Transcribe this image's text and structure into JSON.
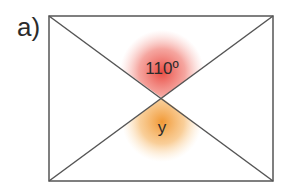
{
  "figure": {
    "label": "a)",
    "angle_top": "110º",
    "angle_bottom": "y",
    "colors": {
      "line": "#555555",
      "top_glow": "#e8433a",
      "bottom_glow": "#f0932b"
    }
  }
}
